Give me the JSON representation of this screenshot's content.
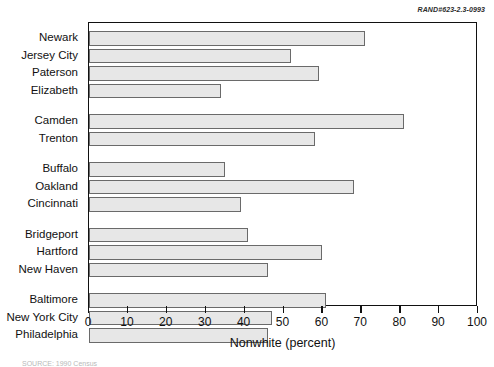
{
  "report_code": "RAND#623-2.3-0993",
  "source_note": "SOURCE: 1990 Census",
  "chart_data": {
    "type": "bar",
    "orientation": "horizontal",
    "title": "",
    "xlabel": "Nonwhite (percent)",
    "ylabel": "",
    "xlim": [
      0,
      100
    ],
    "xticks": [
      0,
      10,
      20,
      30,
      40,
      50,
      60,
      70,
      80,
      90,
      100
    ],
    "xticklabels": [
      "0",
      "10",
      "20",
      "30",
      "40",
      "50",
      "60",
      "70",
      "80",
      "90",
      "100"
    ],
    "grid": false,
    "legend": "none",
    "bar_fill_color": "#e7e7e7",
    "bar_edge_color": "#6a6a6a",
    "groups": [
      {
        "name": "group-1",
        "categories": [
          "Newark",
          "Jersey City",
          "Paterson",
          "Elizabeth"
        ],
        "values": [
          71,
          52,
          59,
          34
        ]
      },
      {
        "name": "group-2",
        "categories": [
          "Camden",
          "Trenton"
        ],
        "values": [
          81,
          58
        ]
      },
      {
        "name": "group-3",
        "categories": [
          "Buffalo",
          "Oakland",
          "Cincinnati"
        ],
        "values": [
          35,
          68,
          39
        ]
      },
      {
        "name": "group-4",
        "categories": [
          "Bridgeport",
          "Hartford",
          "New Haven"
        ],
        "values": [
          41,
          60,
          46
        ]
      },
      {
        "name": "group-5",
        "categories": [
          "Baltimore",
          "New York City",
          "Philadelphia"
        ],
        "values": [
          61,
          47,
          46
        ]
      }
    ],
    "categories": [
      "Newark",
      "Jersey City",
      "Paterson",
      "Elizabeth",
      "Camden",
      "Trenton",
      "Buffalo",
      "Oakland",
      "Cincinnati",
      "Bridgeport",
      "Hartford",
      "New Haven",
      "Baltimore",
      "New York City",
      "Philadelphia"
    ],
    "values": [
      71,
      52,
      59,
      34,
      81,
      58,
      35,
      68,
      39,
      41,
      60,
      46,
      61,
      47,
      46
    ]
  }
}
